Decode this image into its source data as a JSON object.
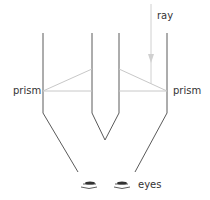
{
  "diagram": {
    "labels": {
      "ray": "ray",
      "prism_left": "prism",
      "prism_right": "prism",
      "eyes": "eyes"
    },
    "colors": {
      "tube": "#5a5a5a",
      "mirror": "#c8c8c8",
      "ray": "#d0d0d0",
      "eyes": "#333333"
    }
  }
}
